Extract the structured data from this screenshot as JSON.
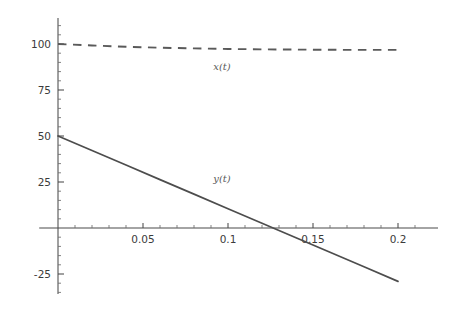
{
  "chart_data": {
    "type": "line",
    "title": "",
    "subtitle": "",
    "xlabel": "",
    "ylabel": "",
    "xlim": [
      -0.004,
      0.22
    ],
    "ylim": [
      -38,
      112
    ],
    "grid": false,
    "legend_position": "inline-annotations",
    "x_ticks": [
      {
        "value": 0.05,
        "label": "0.05"
      },
      {
        "value": 0.1,
        "label": "0.1"
      },
      {
        "value": 0.15,
        "label": "0.15"
      },
      {
        "value": 0.2,
        "label": "0.2"
      }
    ],
    "x_minor_ticks": [
      0.01,
      0.02,
      0.03,
      0.04,
      0.06,
      0.07,
      0.08,
      0.09,
      0.11,
      0.12,
      0.13,
      0.14,
      0.16,
      0.17,
      0.18,
      0.19,
      0.21
    ],
    "y_ticks": [
      {
        "value": 100,
        "label": "100"
      },
      {
        "value": 75,
        "label": "75"
      },
      {
        "value": 50,
        "label": "50"
      },
      {
        "value": 25,
        "label": "25"
      },
      {
        "value": -25,
        "label": "-25"
      }
    ],
    "y_minor_ticks": [
      -35,
      -30,
      -20,
      -15,
      -10,
      -5,
      5,
      10,
      15,
      20,
      30,
      35,
      40,
      45,
      55,
      60,
      65,
      70,
      80,
      85,
      90,
      95,
      105,
      110
    ],
    "series": [
      {
        "name": "x(t)",
        "label": "x(t)",
        "style": "dashed",
        "color": "#5a5a5a",
        "label_point": {
          "x": 0.0965,
          "y": 86
        },
        "x": [
          0.0,
          0.02,
          0.04,
          0.06,
          0.08,
          0.1,
          0.12,
          0.14,
          0.16,
          0.18,
          0.2
        ],
        "values": [
          100.0,
          99.2,
          98.5,
          98.0,
          97.6,
          97.3,
          97.1,
          96.95,
          96.85,
          96.8,
          96.8
        ]
      },
      {
        "name": "y(t)",
        "label": "y(t)",
        "style": "solid",
        "color": "#4d4d4d",
        "label_point": {
          "x": 0.0965,
          "y": 25
        },
        "x": [
          0.0,
          0.02,
          0.04,
          0.06,
          0.08,
          0.1,
          0.12,
          0.14,
          0.16,
          0.18,
          0.2
        ],
        "values": [
          50.0,
          42.1,
          34.2,
          26.3,
          18.4,
          10.5,
          2.6,
          -5.3,
          -13.2,
          -21.1,
          -29.0
        ]
      }
    ],
    "axis_color": "#4a4a4a",
    "zero_crossing": {
      "series": "y(t)",
      "x": 0.127,
      "y": 0
    }
  }
}
